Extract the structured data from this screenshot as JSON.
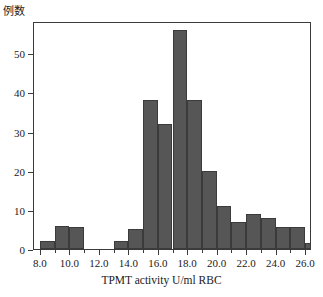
{
  "chart_data": {
    "type": "bar",
    "title": "",
    "xlabel": "TPMT activity U/ml RBC",
    "ylabel": "例数",
    "xlim": [
      7.6,
      26.4
    ],
    "ylim": [
      0,
      58
    ],
    "grid": false,
    "legend": "none",
    "bin_width": 1.0,
    "xticks": [
      "8.0",
      "10.0",
      "12.0",
      "14.0",
      "16.0",
      "18.0",
      "20.0",
      "22.0",
      "24.0",
      "26.0"
    ],
    "xtick_values": [
      8.0,
      10.0,
      12.0,
      14.0,
      16.0,
      18.0,
      20.0,
      22.0,
      24.0,
      26.0
    ],
    "yticks": [
      "0",
      "10",
      "20",
      "30",
      "40",
      "50"
    ],
    "ytick_values": [
      0,
      10,
      20,
      30,
      40,
      50
    ],
    "bars": [
      {
        "bin_start": 8.0,
        "bin_end": 9.0,
        "value": 2
      },
      {
        "bin_start": 9.0,
        "bin_end": 10.0,
        "value": 6
      },
      {
        "bin_start": 10.0,
        "bin_end": 11.0,
        "value": 5.5
      },
      {
        "bin_start": 11.0,
        "bin_end": 12.0,
        "value": 0
      },
      {
        "bin_start": 12.0,
        "bin_end": 13.0,
        "value": 0
      },
      {
        "bin_start": 13.0,
        "bin_end": 14.0,
        "value": 2
      },
      {
        "bin_start": 14.0,
        "bin_end": 15.0,
        "value": 5
      },
      {
        "bin_start": 15.0,
        "bin_end": 16.0,
        "value": 38
      },
      {
        "bin_start": 16.0,
        "bin_end": 17.0,
        "value": 32
      },
      {
        "bin_start": 17.0,
        "bin_end": 18.0,
        "value": 56
      },
      {
        "bin_start": 18.0,
        "bin_end": 19.0,
        "value": 38
      },
      {
        "bin_start": 19.0,
        "bin_end": 20.0,
        "value": 20
      },
      {
        "bin_start": 20.0,
        "bin_end": 21.0,
        "value": 11
      },
      {
        "bin_start": 21.0,
        "bin_end": 22.0,
        "value": 7
      },
      {
        "bin_start": 22.0,
        "bin_end": 23.0,
        "value": 9
      },
      {
        "bin_start": 23.0,
        "bin_end": 24.0,
        "value": 8
      },
      {
        "bin_start": 24.0,
        "bin_end": 25.0,
        "value": 5.5
      },
      {
        "bin_start": 25.0,
        "bin_end": 26.0,
        "value": 5.5
      },
      {
        "bin_start": 26.0,
        "bin_end": 26.4,
        "value": 1.5
      }
    ],
    "categories": [
      "8-9",
      "9-10",
      "10-11",
      "11-12",
      "12-13",
      "13-14",
      "14-15",
      "15-16",
      "16-17",
      "17-18",
      "18-19",
      "19-20",
      "20-21",
      "21-22",
      "22-23",
      "23-24",
      "24-25",
      "25-26",
      "26+"
    ],
    "values": [
      2,
      6,
      5.5,
      0,
      0,
      2,
      5,
      38,
      32,
      56,
      38,
      20,
      11,
      7,
      9,
      8,
      5.5,
      5.5,
      1.5
    ]
  },
  "colors": {
    "bar_fill": "#565656",
    "bar_edge": "#3b3b3b",
    "axis": "#3a3a3a",
    "text": "#1a1a1a",
    "background": "#ffffff"
  }
}
